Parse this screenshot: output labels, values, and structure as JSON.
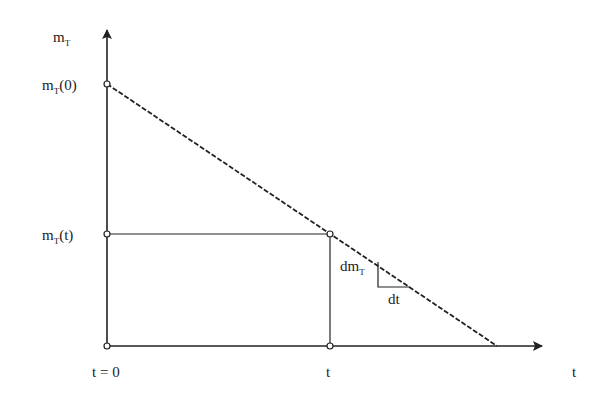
{
  "diagram": {
    "y_axis_label": {
      "main": "m",
      "sub": "T"
    },
    "x_axis_label": "t",
    "labels": {
      "initial": {
        "main": "m",
        "sub": "T",
        "suffix": "(0)"
      },
      "current": {
        "main": "m",
        "sub": "T",
        "suffix": "(t)"
      },
      "t_zero": "t = 0",
      "t_current": "t",
      "slope_vertical": {
        "main": "dm",
        "sub": "T"
      },
      "slope_horizontal": "dt"
    },
    "colors": {
      "line": "#222222",
      "background": "#ffffff"
    }
  }
}
